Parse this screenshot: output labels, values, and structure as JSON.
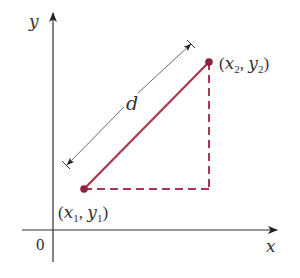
{
  "diagram": {
    "axes": {
      "x_label": "x",
      "y_label": "y",
      "origin_label": "0"
    },
    "points": [
      {
        "name": "P1",
        "label_x": "x",
        "label_y": "y",
        "sub": "1",
        "display": "(x1, y1)"
      },
      {
        "name": "P2",
        "label_x": "x",
        "label_y": "y",
        "sub": "2",
        "display": "(x2, y2)"
      }
    ],
    "distance_label": "d",
    "colors": {
      "segment": "#a8374f",
      "dashed": "#a8374f",
      "axis": "#333333",
      "dimension_line": "#555555"
    }
  }
}
